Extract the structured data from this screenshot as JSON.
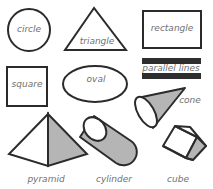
{
  "colors": {
    "stroke": "#2b2b2b",
    "fill_shaded": "#b5b5b5",
    "bar_fill": "#2e2e2e",
    "label": "#6f6f6f",
    "background": "#ffffff"
  },
  "shapes": [
    {
      "id": "circle",
      "label": "circle"
    },
    {
      "id": "triangle",
      "label": "triangle"
    },
    {
      "id": "rectangle",
      "label": "rectangle"
    },
    {
      "id": "square",
      "label": "square"
    },
    {
      "id": "oval",
      "label": "oval"
    },
    {
      "id": "parallel-lines",
      "label": "parallel lines"
    },
    {
      "id": "cone",
      "label": "cone"
    },
    {
      "id": "pyramid",
      "label": "pyramid"
    },
    {
      "id": "cylinder",
      "label": "cylinder"
    },
    {
      "id": "cube",
      "label": "cube"
    }
  ]
}
